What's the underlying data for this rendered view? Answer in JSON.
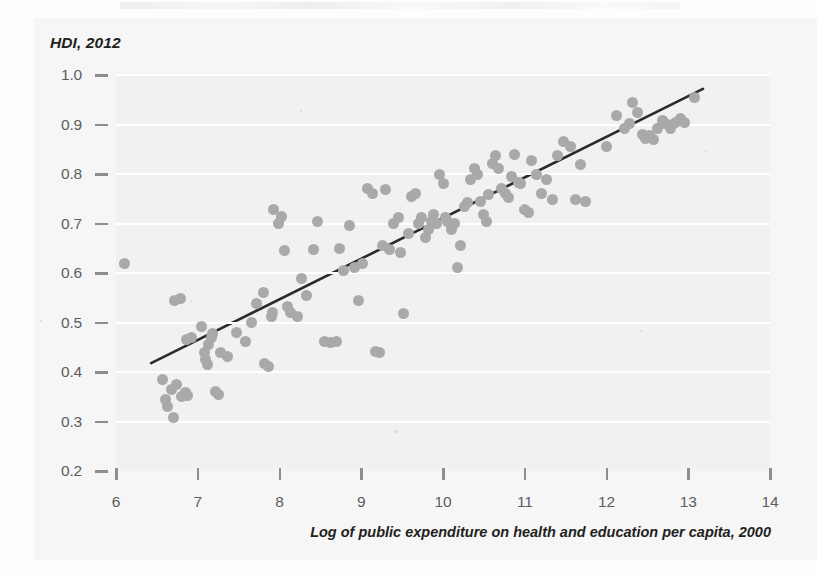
{
  "figure": {
    "y_axis_title": "HDI, 2012",
    "x_axis_title": "Log of public expenditure on health and education per capita, 2000"
  },
  "chart_data": {
    "type": "scatter",
    "title": "",
    "subtitle": "",
    "xlabel": "Log of public expenditure on health and education per capita, 2000",
    "ylabel": "HDI, 2012",
    "xlim": [
      6,
      14
    ],
    "ylim": [
      0.2,
      1.0
    ],
    "xticks": [
      6,
      7,
      8,
      9,
      10,
      11,
      12,
      13,
      14
    ],
    "yticks": [
      0.2,
      0.3,
      0.4,
      0.5,
      0.6,
      0.7,
      0.8,
      0.9,
      1.0
    ],
    "xtick_labels": [
      "6",
      "7",
      "8",
      "9",
      "10",
      "11",
      "12",
      "13",
      "14"
    ],
    "ytick_labels": [
      "0.2",
      "0.3",
      "0.4",
      "0.5",
      "0.6",
      "0.7",
      "0.8",
      "0.9",
      "1.0"
    ],
    "grid": "horizontal",
    "legend": "none",
    "marker": {
      "shape": "circle",
      "color": "#a9a9a9",
      "size_px": 11
    },
    "trendline": {
      "type": "linear",
      "color": "#2b2b2b",
      "width_px": 2.6,
      "x_start": 6.43,
      "y_start": 0.418,
      "x_end": 13.18,
      "y_end": 0.972,
      "slope": 0.0821,
      "intercept": -0.1097
    },
    "n_points": 132,
    "points": [
      [
        6.11,
        0.62
      ],
      [
        6.57,
        0.385
      ],
      [
        6.6,
        0.345
      ],
      [
        6.63,
        0.33
      ],
      [
        6.68,
        0.365
      ],
      [
        6.7,
        0.308
      ],
      [
        6.72,
        0.545
      ],
      [
        6.79,
        0.548
      ],
      [
        6.74,
        0.375
      ],
      [
        6.8,
        0.35
      ],
      [
        6.85,
        0.358
      ],
      [
        6.88,
        0.352
      ],
      [
        6.86,
        0.465
      ],
      [
        6.92,
        0.47
      ],
      [
        7.05,
        0.492
      ],
      [
        7.08,
        0.44
      ],
      [
        7.1,
        0.425
      ],
      [
        7.12,
        0.415
      ],
      [
        7.13,
        0.455
      ],
      [
        7.17,
        0.47
      ],
      [
        7.18,
        0.478
      ],
      [
        7.22,
        0.36
      ],
      [
        7.25,
        0.355
      ],
      [
        7.28,
        0.44
      ],
      [
        7.36,
        0.432
      ],
      [
        7.47,
        0.48
      ],
      [
        7.58,
        0.462
      ],
      [
        7.66,
        0.5
      ],
      [
        7.72,
        0.538
      ],
      [
        7.8,
        0.56
      ],
      [
        7.82,
        0.418
      ],
      [
        7.86,
        0.412
      ],
      [
        7.9,
        0.512
      ],
      [
        7.92,
        0.52
      ],
      [
        7.93,
        0.728
      ],
      [
        7.99,
        0.7
      ],
      [
        8.02,
        0.715
      ],
      [
        8.06,
        0.645
      ],
      [
        8.1,
        0.532
      ],
      [
        8.14,
        0.52
      ],
      [
        8.22,
        0.512
      ],
      [
        8.27,
        0.588
      ],
      [
        8.33,
        0.555
      ],
      [
        8.41,
        0.648
      ],
      [
        8.47,
        0.705
      ],
      [
        8.55,
        0.462
      ],
      [
        8.62,
        0.46
      ],
      [
        8.7,
        0.462
      ],
      [
        8.74,
        0.65
      ],
      [
        8.78,
        0.605
      ],
      [
        8.86,
        0.695
      ],
      [
        8.92,
        0.612
      ],
      [
        8.97,
        0.545
      ],
      [
        9.02,
        0.62
      ],
      [
        9.08,
        0.77
      ],
      [
        9.14,
        0.76
      ],
      [
        9.18,
        0.442
      ],
      [
        9.22,
        0.44
      ],
      [
        9.26,
        0.655
      ],
      [
        9.3,
        0.768
      ],
      [
        9.34,
        0.648
      ],
      [
        9.4,
        0.7
      ],
      [
        9.45,
        0.712
      ],
      [
        9.48,
        0.642
      ],
      [
        9.52,
        0.518
      ],
      [
        9.58,
        0.68
      ],
      [
        9.62,
        0.755
      ],
      [
        9.66,
        0.76
      ],
      [
        9.7,
        0.7
      ],
      [
        9.74,
        0.712
      ],
      [
        9.78,
        0.672
      ],
      [
        9.82,
        0.688
      ],
      [
        9.86,
        0.705
      ],
      [
        9.88,
        0.718
      ],
      [
        9.92,
        0.7
      ],
      [
        9.96,
        0.798
      ],
      [
        10.0,
        0.78
      ],
      [
        10.03,
        0.712
      ],
      [
        10.06,
        0.705
      ],
      [
        10.1,
        0.688
      ],
      [
        10.14,
        0.7
      ],
      [
        10.18,
        0.612
      ],
      [
        10.22,
        0.655
      ],
      [
        10.26,
        0.735
      ],
      [
        10.3,
        0.742
      ],
      [
        10.34,
        0.788
      ],
      [
        10.38,
        0.812
      ],
      [
        10.42,
        0.798
      ],
      [
        10.46,
        0.745
      ],
      [
        10.5,
        0.718
      ],
      [
        10.53,
        0.705
      ],
      [
        10.56,
        0.758
      ],
      [
        10.6,
        0.822
      ],
      [
        10.64,
        0.838
      ],
      [
        10.68,
        0.812
      ],
      [
        10.72,
        0.77
      ],
      [
        10.76,
        0.76
      ],
      [
        10.8,
        0.752
      ],
      [
        10.84,
        0.795
      ],
      [
        10.88,
        0.84
      ],
      [
        10.92,
        0.782
      ],
      [
        10.95,
        0.78
      ],
      [
        11.0,
        0.728
      ],
      [
        11.04,
        0.722
      ],
      [
        11.08,
        0.828
      ],
      [
        11.14,
        0.8
      ],
      [
        11.2,
        0.76
      ],
      [
        11.26,
        0.788
      ],
      [
        11.34,
        0.748
      ],
      [
        11.4,
        0.838
      ],
      [
        11.48,
        0.865
      ],
      [
        11.56,
        0.855
      ],
      [
        11.62,
        0.748
      ],
      [
        11.68,
        0.82
      ],
      [
        11.74,
        0.745
      ],
      [
        12.0,
        0.855
      ],
      [
        12.12,
        0.918
      ],
      [
        12.22,
        0.892
      ],
      [
        12.28,
        0.902
      ],
      [
        12.32,
        0.945
      ],
      [
        12.38,
        0.925
      ],
      [
        12.44,
        0.88
      ],
      [
        12.48,
        0.872
      ],
      [
        12.52,
        0.878
      ],
      [
        12.58,
        0.87
      ],
      [
        12.62,
        0.892
      ],
      [
        12.68,
        0.908
      ],
      [
        12.72,
        0.902
      ],
      [
        12.78,
        0.892
      ],
      [
        12.84,
        0.905
      ],
      [
        12.9,
        0.912
      ],
      [
        12.96,
        0.905
      ],
      [
        13.08,
        0.955
      ]
    ]
  }
}
